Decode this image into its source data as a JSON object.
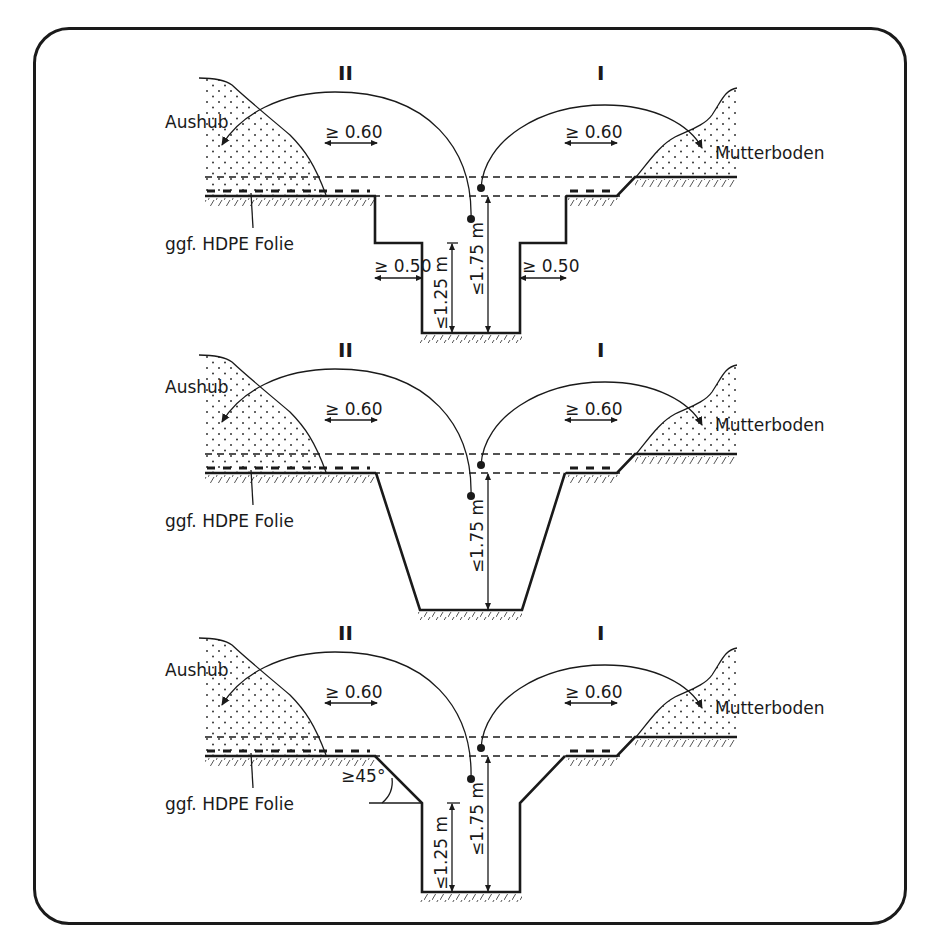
{
  "figure": {
    "colors": {
      "line": "#1a1a1a",
      "background": "#ffffff",
      "soil_fill": "#ffffff",
      "soil_dots": "#333333"
    },
    "panels": [
      {
        "id": "stepped",
        "section_left": "II",
        "section_right": "I",
        "left_pile_label": "Aushub",
        "right_pile_label": "Mutterboden",
        "membrane_label": "ggf. HDPE Folie",
        "left_clearance": "≥ 0.60",
        "right_clearance": "≥ 0.60",
        "step_left": "≥ 0.50",
        "step_right": "≥ 0.50",
        "depth_lower": "≤1.25 m",
        "depth_total": "≤1.75 m"
      },
      {
        "id": "sloped",
        "section_left": "II",
        "section_right": "I",
        "left_pile_label": "Aushub",
        "right_pile_label": "Mutterboden",
        "membrane_label": "ggf. HDPE Folie",
        "left_clearance": "≥ 0.60",
        "right_clearance": "≥ 0.60",
        "depth_total": "≤1.75 m"
      },
      {
        "id": "chamfered",
        "section_left": "II",
        "section_right": "I",
        "left_pile_label": "Aushub",
        "right_pile_label": "Mutterboden",
        "membrane_label": "ggf. HDPE Folie",
        "left_clearance": "≥ 0.60",
        "right_clearance": "≥ 0.60",
        "angle": "≥45°",
        "depth_lower": "≤1.25 m",
        "depth_total": "≤1.75 m"
      }
    ]
  }
}
